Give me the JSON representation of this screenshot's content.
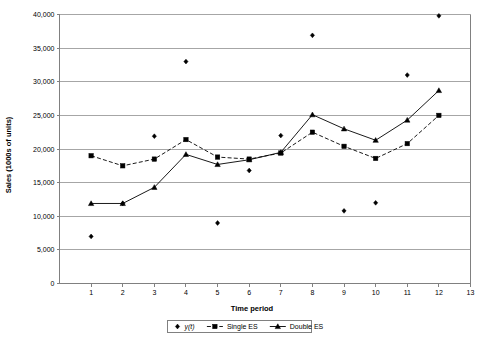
{
  "chart_data": {
    "type": "line",
    "title": "",
    "xlabel": "Time period",
    "ylabel": "Sales (1000s of units)",
    "xlim": [
      0,
      13
    ],
    "ylim": [
      0,
      40000
    ],
    "ytick_step": 5000,
    "grid": "horizontal",
    "legend_position": "bottom-center",
    "x": [
      1,
      2,
      3,
      4,
      5,
      6,
      7,
      8,
      9,
      10,
      11,
      12
    ],
    "xtick_labels": [
      "1",
      "2",
      "3",
      "4",
      "5",
      "6",
      "7",
      "8",
      "9",
      "10",
      "11",
      "12",
      "13"
    ],
    "ytick_labels": [
      "0",
      "5,000",
      "10,000",
      "15,000",
      "20,000",
      "25,000",
      "30,000",
      "35,000",
      "40,000"
    ],
    "ytick_values": [
      0,
      5000,
      10000,
      15000,
      20000,
      25000,
      30000,
      35000,
      40000
    ],
    "series": [
      {
        "name": "y(t)",
        "style": "markers-only",
        "marker": "diamond",
        "values": [
          7000,
          11900,
          21900,
          33000,
          9000,
          16800,
          22000,
          36900,
          10800,
          12000,
          31000,
          39800
        ]
      },
      {
        "name": "Single ES",
        "style": "dashed-line-markers",
        "marker": "square",
        "values": [
          19000,
          17500,
          18500,
          21400,
          18800,
          18500,
          19400,
          22500,
          20400,
          18600,
          20800,
          25000
        ]
      },
      {
        "name": "Double ES",
        "style": "solid-line-markers",
        "marker": "triangle",
        "values": [
          11900,
          11900,
          14300,
          19200,
          17700,
          18400,
          19500,
          25100,
          23000,
          21300,
          24300,
          28700
        ]
      }
    ]
  },
  "legend": {
    "items": [
      {
        "label": "y(t)",
        "marker": "diamond",
        "line": "none"
      },
      {
        "label": "Single ES",
        "marker": "square",
        "line": "dashed"
      },
      {
        "label": "Double ES",
        "marker": "triangle",
        "line": "solid"
      }
    ]
  }
}
